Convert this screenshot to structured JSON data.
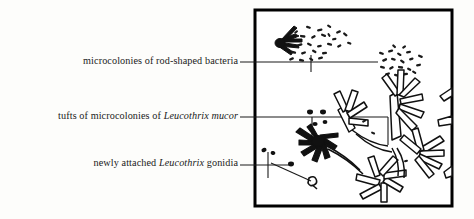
{
  "figure": {
    "kind": "scientific-illustration",
    "frame": {
      "border_color": "#000000",
      "fill_color": "#ffffff",
      "x": 255,
      "y": 10,
      "width": 197,
      "height": 196
    },
    "background_color": "#fdfdfb",
    "ink_color": "#111111"
  },
  "labels": [
    {
      "id": "bacteria",
      "text_before": "microcolonies of rod-shaped bacteria",
      "species": "",
      "text_after": "",
      "leader": {
        "from_x": 240,
        "to_x": 378,
        "y": 62
      }
    },
    {
      "id": "tufts",
      "text_before": "tufts of microcolonies of ",
      "species": "Leucothrix mucor",
      "text_after": "",
      "leader": {
        "from_x": 240,
        "to_x": 388,
        "y": 117
      }
    },
    {
      "id": "gonidia",
      "text_before": "newly attached ",
      "species": "Leucothrix",
      "text_after": " gonidia",
      "leader": {
        "from_x": 240,
        "to_x": 291,
        "y": 165
      }
    }
  ],
  "elements": {
    "dark_tuft_top_left": "filled radiating filament tuft near upper-left of frame",
    "rod_dots_upper": "scattered short rod-shaped bacteria dashes, upper area",
    "rod_dots_right": "second cluster of rod-shaped bacteria dashes, upper right",
    "dark_tuft_center": "filled rosette tuft of Leucothrix, center-left",
    "outlined_tufts_right": "white-filled black-outlined filamentous Leucothrix tufts along right side and bottom",
    "gonidia_dots": "small dark ovals left of center, newly attached gonidia"
  }
}
